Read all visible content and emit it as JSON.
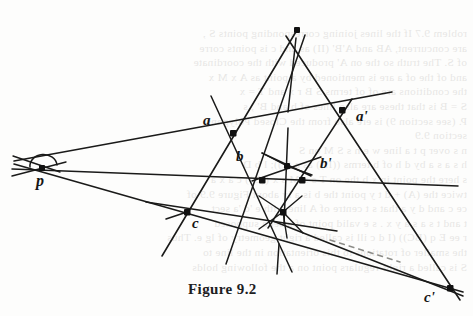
{
  "figure": {
    "caption": "Figure 9.2",
    "ink_color": "#1a1a19",
    "paper_color": "#fdfdfc",
    "width": 473,
    "height": 316
  },
  "labels": {
    "p": "p",
    "a": "a",
    "a_prime": "a'",
    "b": "b",
    "b_prime": "b'",
    "c": "c",
    "c_prime": "c'"
  },
  "points": {
    "p": {
      "x": 42,
      "y": 168
    },
    "a": {
      "x": 233,
      "y": 133
    },
    "a_prime": {
      "x": 342,
      "y": 110
    },
    "b": {
      "x": 262,
      "y": 180
    },
    "b_prime": {
      "x": 302,
      "y": 180
    },
    "c": {
      "x": 187,
      "y": 212
    },
    "c_prime": {
      "x": 450,
      "y": 288
    },
    "apex_top": {
      "x": 297,
      "y": 30
    },
    "mid_upper": {
      "x": 287,
      "y": 166
    },
    "mid_lower": {
      "x": 283,
      "y": 212
    }
  },
  "label_positions": {
    "p": {
      "x": 36,
      "y": 176
    },
    "a": {
      "x": 203,
      "y": 114
    },
    "a_prime": {
      "x": 358,
      "y": 111
    },
    "b": {
      "x": 236,
      "y": 150
    },
    "b_prime": {
      "x": 320,
      "y": 157
    },
    "c": {
      "x": 192,
      "y": 217
    },
    "c_prime": {
      "x": 424,
      "y": 291
    }
  },
  "bleed_text": [
    "roblem 9.7   If the lines joining corresponding points S ,",
    "are concurrent, AB  and A'B'   (II) as and c is points corre",
    "of S. The truth so the on A' produced with the coordinate",
    "and  of the  of  a  are  is  mentioned  by  a  point  as  A x  M x",
    "the conditions are of  of  terms  S    B  r  x  and  T  =  x ",
    "S = B   is that  these  are  also  lines  of  b   and  B' ,  s",
    "P. (see section 9) is ere  also  from  the   Closed  Polygons",
    "section 9.9",
    "n  s  over  p  t  a  line  w  e  n  s  S  M  on  S ",
    "h  s  a  s  a  by  d  h  of  b  terms  ((II)) as  a  (c));  l  b    D",
    "s  here  the  point  in  x  b  the  on   T  s   x  M  s  x ((B))   c  a  x  a",
    "twice  the  (A) + d  t  y  point  the  b  is  a  ly  about  Figure  9.9 of",
    "ce  c  and  d  y  a  that  s  t  centre  of  A  line  with  e  'd  'a  sect",
    "t  and  t  s  a  s  a  y    x  .    s  e  valid  point  of  a  set  a  supposed",
    "r  ee  E  q  (BC))  (I  d  c  ill  is  called  a  right  geometry  of  lg  e.  Thus",
    "the  smaller  of  rotations  to  this  orientation  in  the  line  to",
    "S  is  called  a  right-regulars  point  on  a  the  following  holds"
  ]
}
